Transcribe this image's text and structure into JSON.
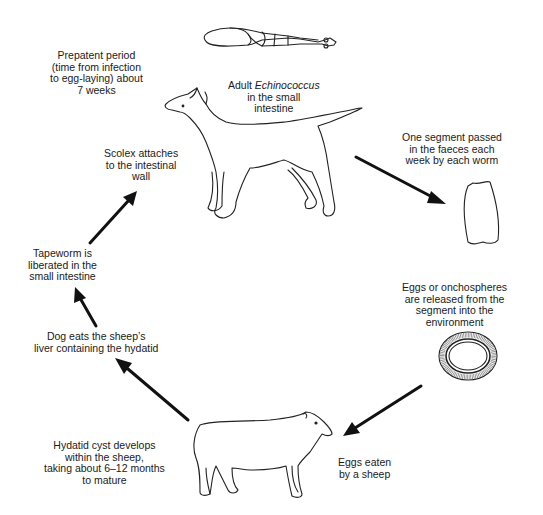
{
  "diagram": {
    "colors": {
      "ink": "#111111",
      "background": "#ffffff"
    },
    "nodes": {
      "adult_worm": {
        "icon": "tapeworm-icon",
        "line1_prefix": "Adult ",
        "line1_italic": "Echinococcus",
        "line2": "in the small",
        "line3": "intestine"
      },
      "prepatent": {
        "lines": [
          "Prepatent period",
          "(time from infection",
          "to egg-laying) about",
          "7 weeks"
        ]
      },
      "dog": {
        "icon": "dog-icon"
      },
      "segment": {
        "icon": "proglottid-segment-icon",
        "lines": [
          "One segment passed",
          "in the faeces each",
          "week by each worm"
        ]
      },
      "eggs": {
        "icon": "egg-onchosphere-icon",
        "lines": [
          "Eggs or onchospheres",
          "are released from the",
          "segment into the",
          "environment"
        ]
      },
      "eaten": {
        "lines": [
          "Eggs eaten",
          "by a sheep"
        ]
      },
      "sheep": {
        "icon": "sheep-icon"
      },
      "hydatid": {
        "lines": [
          "Hydatid cyst develops",
          "within the sheep,",
          "taking about 6–12 months",
          "to mature"
        ]
      },
      "dog_eats": {
        "lines": [
          "Dog eats the sheep’s",
          "liver containing the hydatid"
        ]
      },
      "liberated": {
        "lines": [
          "Tapeworm is",
          "liberated in the",
          "small intestine"
        ]
      },
      "scolex": {
        "lines": [
          "Scolex attaches",
          "to the intestinal",
          "wall"
        ]
      }
    },
    "edges": [
      {
        "from": "dog",
        "to": "segment"
      },
      {
        "from": "eggs",
        "to": "sheep"
      },
      {
        "from": "sheep",
        "to": "dog_eats"
      },
      {
        "from": "dog_eats",
        "to": "liberated"
      },
      {
        "from": "liberated",
        "to": "scolex"
      }
    ]
  }
}
